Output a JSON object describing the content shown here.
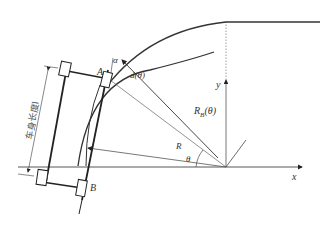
{
  "diagram": {
    "type": "vehicle turning geometry",
    "labels": {
      "point_a": "A",
      "point_b": "B",
      "alpha": "α",
      "offset": "d(θ)",
      "radius_theta": "R",
      "radius_theta_sub": "B",
      "radius_theta_arg": "(θ)",
      "radius": "R",
      "theta": "θ",
      "x_axis": "x",
      "y_axis": "y",
      "body_length": "车身长度l"
    },
    "colors": {
      "stroke": "#222222",
      "thin": "#555555",
      "background": "#ffffff"
    }
  }
}
